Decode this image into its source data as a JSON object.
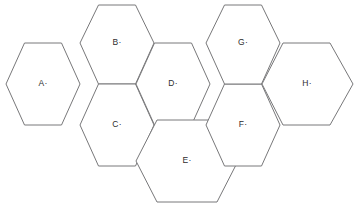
{
  "diagram": {
    "type": "hexagon-honeycomb-grid",
    "title": "",
    "background_color": "#ffffff",
    "stroke_color": "#78787a",
    "stroke_width": 1,
    "label_color": "#2d2d2d",
    "hex_width": 75,
    "hex_height": 82,
    "cells": [
      {
        "id": "hex-a",
        "label": "A·",
        "letter": "A",
        "center_x": 43,
        "center_y": 84,
        "points": "6,84 24.5,43 61.5,43 80,84 61.5,125 24.5,125"
      },
      {
        "id": "hex-b",
        "label": "B·",
        "letter": "B",
        "center_x": 117,
        "center_y": 43,
        "points": "80,43 98.5,5 135.5,5 154,43 135.5,84 98.5,84"
      },
      {
        "id": "hex-c",
        "label": "C·",
        "letter": "C",
        "center_x": 117,
        "center_y": 125,
        "points": "80,125 98.5,84 135.5,84 154,125 135.5,166 98.5,166"
      },
      {
        "id": "hex-d",
        "label": "D·",
        "letter": "D",
        "center_x": 173,
        "center_y": 84,
        "points": "136,84 154.5,43 191.5,43 210,84 191.5,125 154.5,125"
      },
      {
        "id": "hex-e",
        "label": "E·",
        "letter": "E",
        "center_x": 187,
        "center_y": 161,
        "points": "136,161 157,120 217,120 238,161 217,202 157,202"
      },
      {
        "id": "hex-f",
        "label": "F·",
        "letter": "F",
        "center_x": 243,
        "center_y": 125,
        "points": "206,125 224.5,84 261.5,84 280,125 261.5,166 224.5,166"
      },
      {
        "id": "hex-g",
        "label": "G·",
        "letter": "G",
        "center_x": 243,
        "center_y": 43,
        "points": "206,43 224.5,5 261.5,5 280,43 261.5,84 224.5,84"
      },
      {
        "id": "hex-h",
        "label": "H·",
        "letter": "H",
        "center_x": 307,
        "center_y": 84,
        "points": "262,84 283,43 330,43 353,84 330,125 283,125"
      }
    ]
  }
}
